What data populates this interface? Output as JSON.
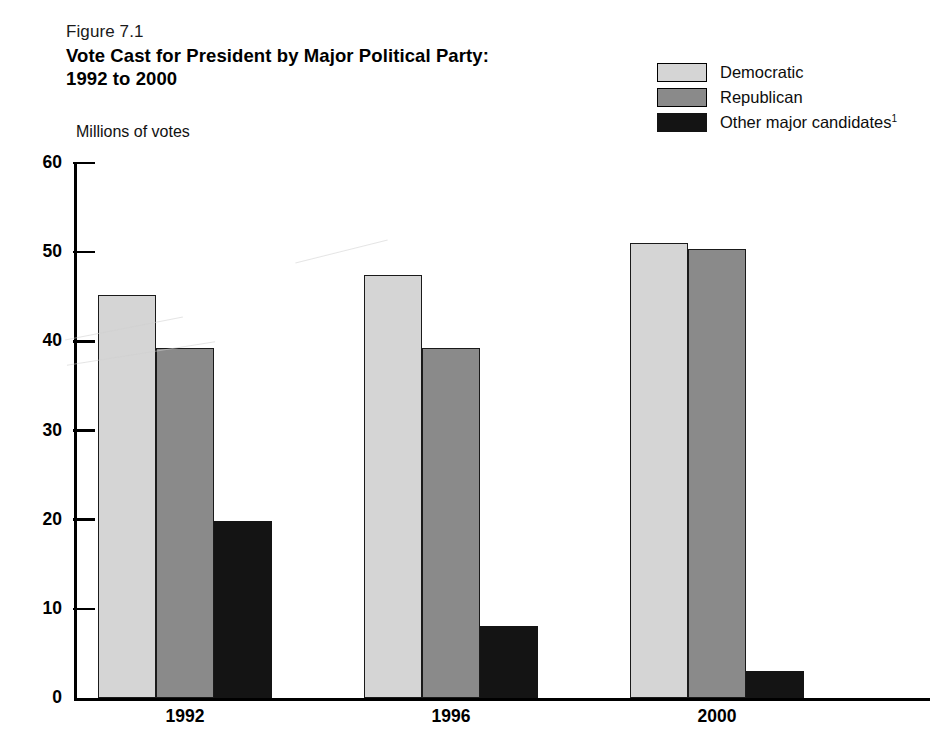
{
  "figure": {
    "number": "Figure 7.1",
    "title_line1": "Vote Cast for President by Major Political Party:",
    "title_line2": "1992 to 2000",
    "unit_label": "Millions of votes"
  },
  "legend": {
    "items": [
      {
        "label": "Democratic",
        "color": "#d5d5d5",
        "swatch_name": "legend-swatch-democratic"
      },
      {
        "label": "Republican",
        "color": "#8a8a8a",
        "swatch_name": "legend-swatch-republican"
      },
      {
        "label": "Other major candidates",
        "footnote": "1",
        "color": "#141414",
        "swatch_name": "legend-swatch-other"
      }
    ]
  },
  "chart_data": {
    "type": "bar",
    "title": "Vote Cast for President by Major Political Party: 1992 to 2000",
    "subtitle": "Figure 7.1",
    "xlabel": "",
    "ylabel": "Millions of votes",
    "ylim": [
      0,
      60
    ],
    "yticks": [
      0,
      10,
      20,
      30,
      40,
      50,
      60
    ],
    "ytick_labels": [
      "0",
      "10",
      "20",
      "30",
      "40",
      "50",
      "60"
    ],
    "grid": false,
    "legend_position": "top-right",
    "categories": [
      "1992",
      "1996",
      "2000"
    ],
    "series": [
      {
        "name": "Democratic",
        "color": "#d5d5d5",
        "values": [
          45.2,
          47.4,
          51.0
        ]
      },
      {
        "name": "Republican",
        "color": "#8a8a8a",
        "values": [
          39.2,
          39.2,
          50.4
        ]
      },
      {
        "name": "Other major candidates",
        "color": "#141414",
        "values": [
          19.9,
          8.1,
          3.0
        ]
      }
    ],
    "annotations": [
      {
        "text": "Other major candidates",
        "footnote_marker": "1"
      }
    ]
  }
}
